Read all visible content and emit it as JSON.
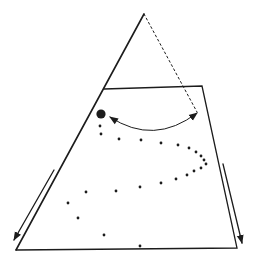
{
  "figure": {
    "canvas": {
      "width": 254,
      "height": 260,
      "background": "#ffffff",
      "ink": "#1c1c1c"
    },
    "cone": {
      "apex": [
        144,
        14
      ],
      "left_edge_end": [
        16,
        250
      ],
      "dotted_edge_end": [
        197,
        112
      ],
      "dotted_dash": "2 2.8"
    },
    "trapezoid": {
      "points": [
        [
          104,
          89
        ],
        [
          202,
          86
        ],
        [
          237,
          248
        ],
        [
          16,
          250
        ]
      ]
    },
    "ball": {
      "cx": 101,
      "cy": 114,
      "r": 4.6
    },
    "swing_arc": {
      "start": [
        110,
        117
      ],
      "control": [
        154,
        146
      ],
      "end": [
        197,
        113
      ]
    },
    "edge_arrows": [
      {
        "name": "left-edge-arrow",
        "from": [
          54,
          170
        ],
        "to": [
          14,
          240
        ]
      },
      {
        "name": "right-edge-arrow",
        "from": [
          223,
          164
        ],
        "to": [
          242,
          243
        ]
      }
    ],
    "trajectory_dots": {
      "radius": 1.4,
      "points": [
        [
          100,
          126
        ],
        [
          101,
          134
        ],
        [
          119,
          139
        ],
        [
          141,
          140
        ],
        [
          161,
          143
        ],
        [
          178,
          145
        ],
        [
          189,
          148
        ],
        [
          196,
          152
        ],
        [
          201,
          156
        ],
        [
          204,
          160
        ],
        [
          206,
          164
        ],
        [
          201,
          168
        ],
        [
          194,
          171
        ],
        [
          187,
          175
        ],
        [
          176,
          179
        ],
        [
          161,
          183
        ],
        [
          140,
          187
        ],
        [
          116,
          191
        ],
        [
          86,
          192
        ],
        [
          68,
          203
        ],
        [
          78,
          218
        ],
        [
          104,
          235
        ],
        [
          140,
          246
        ]
      ]
    }
  }
}
